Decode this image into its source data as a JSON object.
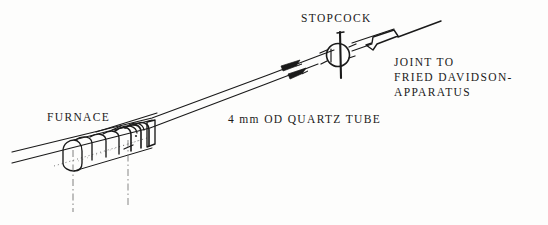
{
  "figure": {
    "ink_color": "#1a1a1a",
    "background_color": "#fdfdfc",
    "width": 548,
    "height": 225
  },
  "labels": {
    "stopcock": "STOPCOCK",
    "furnace": "FURNACE",
    "tube": "4 mm OD QUARTZ TUBE",
    "joint_line1": "JOINT TO",
    "joint_line2": "FRIED DAVIDSON-",
    "joint_line3": "APPARATUS"
  },
  "components": [
    {
      "name": "quartz-tube",
      "label": "4 mm OD QUARTZ TUBE",
      "description": "Two parallel diagonal lines running lower-left to upper-right representing a 4 mm outside diameter quartz tube"
    },
    {
      "name": "furnace",
      "label": "FURNACE",
      "description": "Coiled heating element wound around the quartz tube near the lower-left, with two vertical dash-dot extension lines dropping below"
    },
    {
      "name": "stopcock",
      "label": "STOPCOCK",
      "description": "Circular stopcock body with a vertical handle bar through it, located on the tube upper-right of center"
    },
    {
      "name": "ground-glass-joint",
      "label": "JOINT TO FRIED DAVIDSON-APPARATUS",
      "description": "Tapered ground glass joint on the tube to the right of the stopcock"
    },
    {
      "name": "flow-arrows",
      "label": "",
      "description": "Two small arrowheads on the tube between the furnace and the stopcock indicating gas flow direction toward the stopcock"
    }
  ]
}
